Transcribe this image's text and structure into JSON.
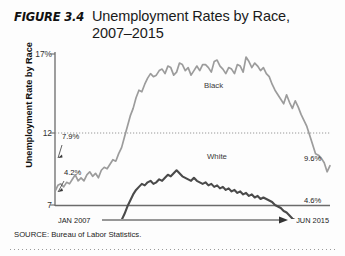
{
  "figure": {
    "label": "FIGURE 3.4",
    "title": "Unemployment Rates by Race, 2007–2015"
  },
  "source": {
    "text": "SOURCE: Bureau of Labor Statistics."
  },
  "axis": {
    "y_label": "Unemployment Rate by Race",
    "y_ticks": [
      "17%",
      "12",
      "7"
    ],
    "x_start": "JAN 2007",
    "x_end": "JUN 2015"
  },
  "annotations": {
    "black_start": "7.9%",
    "black_end": "9.6%",
    "white_start": "4.2%",
    "white_end": "4.6%",
    "black_series": "Black",
    "white_series": "White"
  },
  "colors": {
    "black_line": "#9c9c9c",
    "white_line": "#4a4a4a",
    "axis": "#6b6b6b",
    "gridline": "#8d8d8d"
  },
  "chart_data": {
    "type": "line",
    "title": "Unemployment Rates by Race, 2007–2015",
    "xlabel": "",
    "ylabel": "Unemployment Rate by Race",
    "ylim": [
      7,
      17
    ],
    "yticks": [
      7,
      12,
      17
    ],
    "grid": "horizontal dotted at 12",
    "legend": "inline series labels",
    "x_range": [
      "JAN 2007",
      "JUN 2015"
    ],
    "series": [
      {
        "name": "Black",
        "color": "#9c9c9c",
        "start_value": 7.9,
        "end_value": 9.6,
        "peak_value": 16.8,
        "values": [
          7.9,
          8.3,
          8.4,
          8.2,
          8.5,
          8.4,
          8.7,
          9.0,
          8.6,
          8.8,
          8.6,
          9.0,
          9.2,
          8.9,
          9.1,
          8.8,
          9.3,
          9.5,
          9.4,
          9.7,
          10.0,
          9.9,
          10.4,
          10.8,
          11.5,
          12.2,
          12.9,
          13.4,
          14.1,
          14.6,
          14.5,
          15.0,
          15.4,
          15.7,
          15.5,
          15.6,
          15.9,
          16.0,
          15.7,
          16.2,
          16.1,
          15.6,
          15.8,
          16.4,
          16.3,
          15.9,
          16.1,
          15.6,
          15.9,
          16.2,
          15.9,
          16.3,
          16.3,
          16.1,
          15.8,
          16.5,
          16.6,
          16.2,
          16.0,
          15.7,
          16.1,
          16.0,
          15.7,
          16.3,
          16.2,
          15.8,
          16.8,
          16.5,
          16.1,
          16.4,
          16.2,
          15.9,
          16.1,
          15.7,
          15.5,
          15.0,
          14.6,
          14.3,
          14.0,
          13.7,
          14.3,
          13.8,
          13.4,
          13.9,
          13.5,
          13.0,
          12.6,
          12.2,
          11.6,
          11.0,
          10.4,
          10.3,
          10.1,
          9.8,
          9.2,
          9.6
        ]
      },
      {
        "name": "White",
        "color": "#4a4a4a",
        "start_value": 4.2,
        "end_value": 4.6,
        "peak_value": 9.3,
        "values": [
          4.2,
          4.1,
          4.2,
          4.0,
          4.1,
          4.3,
          4.2,
          4.4,
          4.3,
          4.2,
          4.4,
          4.3,
          4.5,
          4.4,
          4.6,
          4.5,
          4.7,
          4.6,
          4.8,
          5.0,
          5.2,
          5.4,
          5.7,
          6.0,
          6.4,
          6.9,
          7.3,
          7.7,
          8.0,
          8.2,
          8.4,
          8.3,
          8.5,
          8.6,
          8.4,
          8.5,
          8.7,
          8.6,
          8.8,
          9.0,
          8.9,
          9.1,
          9.3,
          9.1,
          8.9,
          8.8,
          8.7,
          8.6,
          8.8,
          8.6,
          8.5,
          8.4,
          8.5,
          8.3,
          8.4,
          8.2,
          8.3,
          8.1,
          8.2,
          8.0,
          8.1,
          7.9,
          8.0,
          7.8,
          7.9,
          7.7,
          7.8,
          7.6,
          7.7,
          7.5,
          7.6,
          7.4,
          7.5,
          7.4,
          7.3,
          7.2,
          7.0,
          6.9,
          6.8,
          6.6,
          6.5,
          6.3,
          6.1,
          6.0,
          5.8,
          5.7,
          5.5,
          5.4,
          5.2,
          5.1,
          5.0,
          4.9,
          4.8,
          4.7,
          4.5,
          4.6
        ]
      }
    ]
  }
}
